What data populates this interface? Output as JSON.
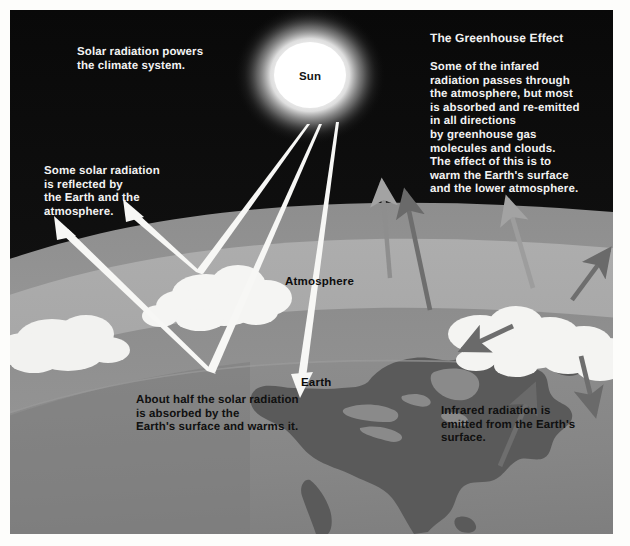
{
  "figure": {
    "title": "The Greenhouse Effect",
    "kind": "greenhouse-effect-diagram"
  },
  "captions": {
    "solar_power": "Solar radiation powers\nthe climate system.",
    "greenhouse_title": "The Greenhouse Effect",
    "greenhouse_body": "Some of the infared\nradiation passes through\nthe atmosphere, but most\nis absorbed and re-emitted\nin all directions\nby greenhouse gas\nmolecules and clouds.\nThe effect of this is to\nwarm the Earth's surface\nand the lower atmosphere.",
    "reflected": "Some solar radiation\nis reflected by\nthe Earth and the\natmosphere.",
    "absorbed": "About half the solar radiation\nis absorbed by the\nEarth's surface and warms it.",
    "infrared": "Infrared radiation is\nemitted from the Earth's\nsurface."
  },
  "scene_labels": {
    "sun": "Sun",
    "atmosphere": "Atmosphere",
    "earth": "Earth"
  },
  "colors": {
    "space": "#0a0a0a",
    "space_haze": "#2a2a2a",
    "atmosphere_outer": "#9a9a9a",
    "atmosphere_mid": "#a9a9a9",
    "atmosphere_inner": "#8f8f8f",
    "earth_ocean": "#8a8a8a",
    "earth_land": "#5c5c5c",
    "cloud": "#f4f4f2",
    "solar_arrow": "#f7f7f5",
    "infrared_arrow": "#6e6e6e",
    "infrared_arrow_light": "#9d9d9d",
    "sun_core": "#ffffff",
    "caption_text": "#f2f2f2",
    "label_text": "#0d0d0d",
    "page": "#ffffff"
  },
  "arrows": {
    "solar_incoming": [
      {
        "name": "ray-to-cloud-top",
        "from": [
          300,
          120
        ],
        "to": [
          196,
          268
        ]
      },
      {
        "name": "ray-to-surface",
        "from": [
          312,
          120
        ],
        "to": [
          205,
          370
        ]
      },
      {
        "name": "ray-absorbed-direct",
        "from": [
          330,
          118
        ],
        "to": [
          297,
          382
        ]
      }
    ],
    "solar_reflected": [
      {
        "name": "reflect-off-cloud",
        "from": [
          196,
          268
        ],
        "to": [
          125,
          198
        ]
      },
      {
        "name": "reflect-off-surface",
        "from": [
          205,
          370
        ],
        "to": [
          53,
          218
        ]
      }
    ],
    "infrared": [
      {
        "name": "ir-up-left-edge",
        "from": [
          420,
          300
        ],
        "to": [
          392,
          178
        ]
      },
      {
        "name": "ir-up-center",
        "from": [
          522,
          278
        ],
        "to": [
          494,
          185
        ]
      },
      {
        "name": "ir-up-right",
        "from": [
          562,
          288
        ],
        "to": [
          600,
          235
        ]
      },
      {
        "name": "ir-down-left",
        "from": [
          500,
          317
        ],
        "to": [
          448,
          337
        ]
      },
      {
        "name": "ir-up-from-surface",
        "from": [
          492,
          453
        ],
        "to": [
          522,
          375
        ]
      },
      {
        "name": "ir-down-right",
        "from": [
          570,
          348
        ],
        "to": [
          583,
          405
        ]
      }
    ]
  }
}
